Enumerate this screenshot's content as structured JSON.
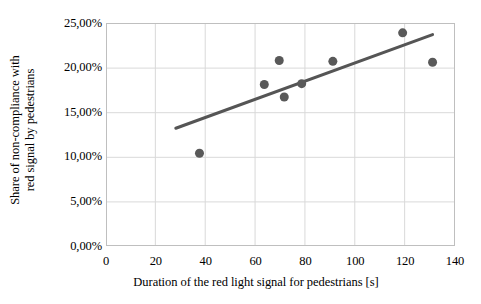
{
  "chart_data": {
    "type": "scatter",
    "title": "",
    "xlabel": "Duration of the red light signal for pedestrians [s]",
    "ylabel_line1": "Share of non-compliance with",
    "ylabel_line2": "red signal by pedestrians",
    "ylabel": "Share of non-compliance with red signal by pedestrians",
    "xlim": [
      0,
      140
    ],
    "ylim": [
      0,
      25
    ],
    "grid": true,
    "legend": "none",
    "decimal_separator": ",",
    "x_ticks": [
      {
        "value": 0,
        "label": "0"
      },
      {
        "value": 20,
        "label": "20"
      },
      {
        "value": 40,
        "label": "40"
      },
      {
        "value": 60,
        "label": "60"
      },
      {
        "value": 80,
        "label": "80"
      },
      {
        "value": 100,
        "label": "100"
      },
      {
        "value": 120,
        "label": "120"
      },
      {
        "value": 140,
        "label": "140"
      }
    ],
    "y_ticks": [
      {
        "value": 0,
        "label": "0,00%"
      },
      {
        "value": 5,
        "label": "5,00%"
      },
      {
        "value": 10,
        "label": "10,00%"
      },
      {
        "value": 15,
        "label": "15,00%"
      },
      {
        "value": 20,
        "label": "20,00%"
      },
      {
        "value": 25,
        "label": "25,00%"
      }
    ],
    "series": [
      {
        "name": "observations",
        "type": "scatter",
        "marker": "circle",
        "marker_size": 9,
        "color": "#595959",
        "points": [
          {
            "x": 37.5,
            "y": 10.4
          },
          {
            "x": 63.5,
            "y": 18.1
          },
          {
            "x": 69.5,
            "y": 20.8
          },
          {
            "x": 71.5,
            "y": 16.7
          },
          {
            "x": 78.5,
            "y": 18.2
          },
          {
            "x": 91.0,
            "y": 20.7
          },
          {
            "x": 119.0,
            "y": 23.9
          },
          {
            "x": 131.0,
            "y": 20.6
          }
        ]
      },
      {
        "name": "linear-trendline",
        "type": "line",
        "color": "#555555",
        "width": 3,
        "points": [
          {
            "x": 28.0,
            "y": 13.2
          },
          {
            "x": 131.0,
            "y": 23.7
          }
        ]
      }
    ],
    "colors": {
      "marker": "#595959",
      "trendline": "#555555",
      "gridline": "#d9d9d9",
      "axis": "#bfbfbf",
      "text": "#000000",
      "background": "#ffffff"
    }
  }
}
